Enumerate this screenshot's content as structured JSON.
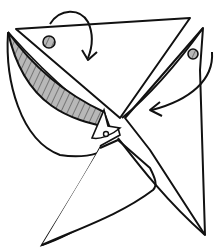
{
  "diagram": {
    "type": "origami-fold-step",
    "colors": {
      "line": "#111111",
      "shade": "#b8b8b8",
      "hatch": "#222222",
      "paper": "#ffffff"
    },
    "elements": {
      "arrows": [
        {
          "name": "top-fold-arrow",
          "direction": "down"
        },
        {
          "name": "right-fold-arrow",
          "direction": "left"
        }
      ],
      "dots": [
        {
          "name": "top-left-dot"
        },
        {
          "name": "right-dot"
        },
        {
          "name": "center-dot"
        }
      ],
      "shaded_flaps": [
        {
          "name": "left-shaded-flap"
        },
        {
          "name": "bottom-shaded-flap"
        }
      ]
    }
  }
}
